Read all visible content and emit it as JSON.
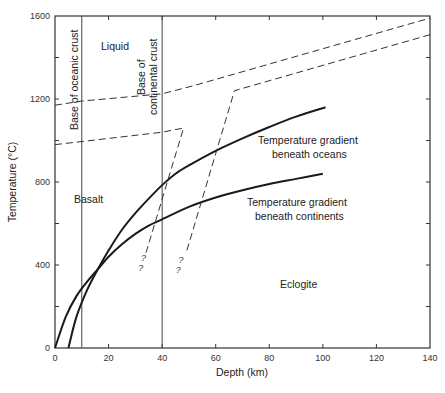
{
  "chart_data": {
    "type": "line",
    "title": "",
    "xlabel": "Depth (km)",
    "ylabel": "Temperature (°C)",
    "xlim": [
      0,
      140
    ],
    "ylim": [
      0,
      1600
    ],
    "grid": false,
    "x_ticks": [
      0,
      20,
      40,
      60,
      80,
      100,
      120,
      140
    ],
    "x_tick_labels": [
      "0",
      "20",
      "40",
      "60",
      "80",
      "100",
      "120",
      "140"
    ],
    "y_ticks": [
      0,
      200,
      400,
      600,
      800,
      1000,
      1200,
      1400,
      1600
    ],
    "y_tick_labels": [
      "0",
      "",
      "400",
      "",
      "800",
      "",
      "1200",
      "",
      "1600"
    ],
    "series": [
      {
        "name": "Temperature gradient beneath oceans",
        "style": "solid-thick",
        "points": [
          [
            5,
            0
          ],
          [
            8,
            150
          ],
          [
            12,
            280
          ],
          [
            16,
            380
          ],
          [
            20,
            470
          ],
          [
            25,
            570
          ],
          [
            30,
            650
          ],
          [
            35,
            720
          ],
          [
            40,
            785
          ],
          [
            45,
            840
          ],
          [
            50,
            880
          ],
          [
            60,
            950
          ],
          [
            70,
            1010
          ],
          [
            80,
            1065
          ],
          [
            90,
            1115
          ],
          [
            101,
            1160
          ]
        ]
      },
      {
        "name": "Temperature gradient beneath continents",
        "style": "solid-thick",
        "points": [
          [
            0,
            0
          ],
          [
            4,
            150
          ],
          [
            8,
            250
          ],
          [
            12,
            320
          ],
          [
            16,
            380
          ],
          [
            20,
            440
          ],
          [
            25,
            500
          ],
          [
            30,
            550
          ],
          [
            35,
            590
          ],
          [
            40,
            620
          ],
          [
            50,
            680
          ],
          [
            60,
            725
          ],
          [
            70,
            760
          ],
          [
            80,
            790
          ],
          [
            90,
            815
          ],
          [
            100,
            840
          ]
        ]
      },
      {
        "name": "Liquidus boundary",
        "style": "dashed",
        "points": [
          [
            0,
            1170
          ],
          [
            10,
            1190
          ],
          [
            40,
            1225
          ],
          [
            52,
            1265
          ],
          [
            140,
            1590
          ]
        ]
      },
      {
        "name": "Basalt solidus boundary",
        "style": "dashed",
        "points": [
          [
            0,
            980
          ],
          [
            40,
            1040
          ],
          [
            48,
            1060
          ],
          [
            34,
            460
          ]
        ]
      },
      {
        "name": "Eclogite boundary",
        "style": "dashed",
        "points": [
          [
            140,
            1510
          ],
          [
            67,
            1240
          ],
          [
            49,
            460
          ]
        ]
      }
    ],
    "vertical_lines": [
      {
        "x": 10,
        "label": "Base of oceanic crust"
      },
      {
        "x": 40,
        "label_line1": "Base of",
        "label_line2": "continental crust"
      }
    ],
    "annotations": {
      "liquid": "Liquid",
      "basalt": "Basalt",
      "eclogite": "Eclogite",
      "ocean_line1": "Temperature gradient",
      "ocean_line2": "beneath oceans",
      "cont_line1": "Temperature gradient",
      "cont_line2": "beneath continents",
      "question_mark": "?"
    },
    "question_marks": [
      [
        33,
        420
      ],
      [
        32,
        370
      ],
      [
        47,
        410
      ],
      [
        46,
        360
      ]
    ]
  }
}
